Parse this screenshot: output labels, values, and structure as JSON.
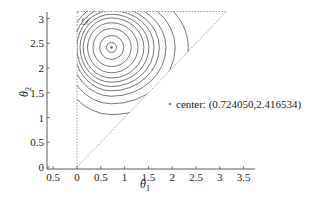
{
  "chart_data": {
    "type": "contour",
    "title": "",
    "xlabel": "θ1",
    "ylabel": "θ2",
    "xlim": [
      -0.6,
      3.7
    ],
    "ylim": [
      0,
      3.2
    ],
    "x_ticks": [
      "0.5",
      "0",
      "0.5",
      "1",
      "1.5",
      "2",
      "2.5",
      "3",
      "3.5"
    ],
    "x_tick_values": [
      -0.5,
      0,
      0.5,
      1,
      1.5,
      2,
      2.5,
      3,
      3.5
    ],
    "y_ticks": [
      "0",
      "0.5",
      "1",
      "1.5",
      "2",
      "2.5",
      "3"
    ],
    "y_tick_values": [
      0,
      0.5,
      1,
      1.5,
      2,
      2.5,
      3
    ],
    "grid": false,
    "domain": {
      "label": "𝒟",
      "vertices": [
        [
          0,
          0
        ],
        [
          0,
          3.1416
        ],
        [
          3.1416,
          3.1416
        ]
      ],
      "style": "dotted"
    },
    "center": {
      "x": 0.72405,
      "y": 2.416534
    },
    "contour_levels": 11,
    "legend": {
      "entries": [
        "center: (0.724050,2.416534)"
      ],
      "position": "right"
    }
  },
  "legend": {
    "label": "center: (0.724050,2.416534)"
  },
  "axes": {
    "xlabel_main": "θ",
    "xlabel_sub": "1",
    "ylabel_main": "θ",
    "ylabel_sub": "2",
    "domain_label": "𝒟"
  }
}
